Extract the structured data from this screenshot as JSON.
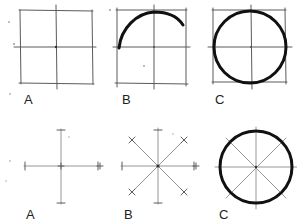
{
  "colors": {
    "guide": "#5a5a5a",
    "stroke": "#111111",
    "background": "#ffffff"
  },
  "top_row": {
    "description": "Circle drawn inside a square with centre lines",
    "steps": [
      {
        "label": "A",
        "caption": "square with centre cross"
      },
      {
        "label": "B",
        "caption": "arc started from left midpoint"
      },
      {
        "label": "C",
        "caption": "completed circle touching midpoints"
      }
    ]
  },
  "bottom_row": {
    "description": "Circle drawn from radial marks",
    "steps": [
      {
        "label": "A",
        "caption": "cross with radius marks"
      },
      {
        "label": "B",
        "caption": "diagonals added with radius marks"
      },
      {
        "label": "C",
        "caption": "circle through the eight marks"
      }
    ]
  }
}
